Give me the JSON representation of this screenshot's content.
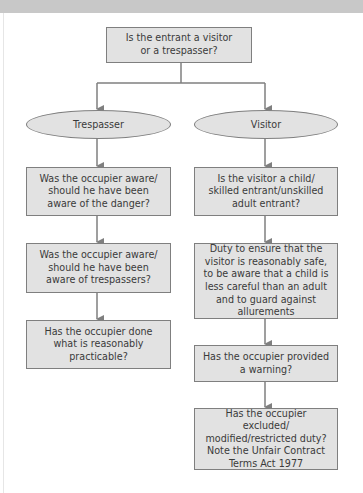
{
  "flowchart": {
    "root": {
      "text": "Is the entrant a visitor or a trespasser?",
      "lines": [
        "Is the entrant a visitor",
        "or a trespasser?"
      ]
    },
    "branches": {
      "trespasser": {
        "label": "Trespasser",
        "steps": [
          {
            "text": "Was the occupier aware/ should he have been aware of the danger?"
          },
          {
            "text": "Was the occupier aware/ should he have been aware of trespassers?"
          },
          {
            "text": "Has the occupier done what is reasonably practicable?"
          }
        ]
      },
      "visitor": {
        "label": "Visitor",
        "steps": [
          {
            "text": "Is the visitor a child/ skilled entrant/unskilled adult entrant?"
          },
          {
            "text": "Duty to ensure that the visitor is reasonably safe, to be aware that a child is less careful than an adult and to guard against allurements"
          },
          {
            "text": "Has the occupier provided a warning?"
          },
          {
            "text": "Has the occupier excluded/ modified/restricted duty? Note the Unfair Contract Terms Act 1977"
          }
        ]
      }
    },
    "colors": {
      "box_fill": "#e2e2e2",
      "box_border": "#7f7f7f",
      "connector": "#7f7f7f",
      "text": "#3a3a3a",
      "header_band": "#c8c8c8"
    }
  }
}
